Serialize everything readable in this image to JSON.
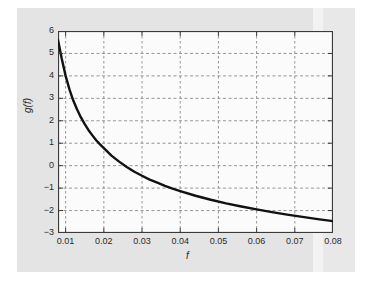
{
  "figure": {
    "background_color": "#ffffff",
    "panel_color": "#e4e4e4",
    "plot_background": "#fbfbfb",
    "axis_color": "#3a3a3a",
    "grid_color": "#8a8a8a",
    "curve_color": "#111111"
  },
  "chart_data": {
    "type": "line",
    "title": "",
    "subtitle": "",
    "xlabel": "f",
    "ylabel": "g(f)",
    "xlim": [
      0.008,
      0.08
    ],
    "ylim": [
      -3,
      6
    ],
    "grid": true,
    "legend": null,
    "xticks": [
      0.01,
      0.02,
      0.03,
      0.04,
      0.05,
      0.06,
      0.07,
      0.08
    ],
    "xtick_labels": [
      "0.01",
      "0.02",
      "0.03",
      "0.04",
      "0.05",
      "0.06",
      "0.07",
      "0.08"
    ],
    "yticks": [
      -3,
      -2,
      -1,
      0,
      1,
      2,
      3,
      4,
      5,
      6
    ],
    "ytick_labels": [
      "-3",
      "-2",
      "-1",
      "0",
      "1",
      "2",
      "3",
      "4",
      "5",
      "6"
    ],
    "series": [
      {
        "name": "g(f)",
        "color": "#111111",
        "linewidth": 2.4,
        "x": [
          0.008,
          0.009,
          0.01,
          0.011,
          0.012,
          0.013,
          0.014,
          0.015,
          0.016,
          0.017,
          0.018,
          0.019,
          0.02,
          0.022,
          0.024,
          0.026,
          0.028,
          0.03,
          0.032,
          0.034,
          0.036,
          0.038,
          0.04,
          0.044,
          0.048,
          0.052,
          0.056,
          0.06,
          0.064,
          0.068,
          0.072,
          0.076,
          0.08
        ],
        "y": [
          5.6,
          4.75,
          4.0,
          3.4,
          2.9,
          2.5,
          2.15,
          1.85,
          1.58,
          1.35,
          1.13,
          0.95,
          0.78,
          0.45,
          0.18,
          -0.06,
          -0.27,
          -0.45,
          -0.62,
          -0.76,
          -0.9,
          -1.02,
          -1.13,
          -1.34,
          -1.52,
          -1.68,
          -1.82,
          -1.95,
          -2.07,
          -2.18,
          -2.28,
          -2.38,
          -2.47
        ]
      }
    ]
  },
  "axes": {
    "y_axis_label": "g(f)",
    "x_axis_label": "f"
  }
}
